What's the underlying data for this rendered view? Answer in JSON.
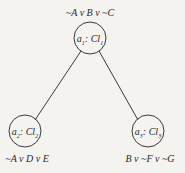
{
  "diagram": {
    "type": "tree",
    "nodes": [
      {
        "id": "a1",
        "agent": "a",
        "agent_sub": "1",
        "sep": ":",
        "clause_set": "Cl",
        "clause_sub": "1",
        "clause": "~A v B v ~C",
        "cx": 90,
        "cy": 38
      },
      {
        "id": "a2",
        "agent": "a",
        "agent_sub": "2",
        "sep": ":",
        "clause_set": "Cl",
        "clause_sub": "2",
        "clause": "~A v D v E",
        "cx": 25,
        "cy": 131
      },
      {
        "id": "a3",
        "agent": "a",
        "agent_sub": "3",
        "sep": ":",
        "clause_set": "Cl",
        "clause_sub": "3",
        "clause": "B v ~F v ~G",
        "cx": 148,
        "cy": 131
      }
    ],
    "edges": [
      {
        "from": "a1",
        "to": "a2"
      },
      {
        "from": "a1",
        "to": "a3"
      }
    ],
    "colors": {
      "stroke": "#3a3a3a",
      "background": "#f4f3f0"
    }
  }
}
